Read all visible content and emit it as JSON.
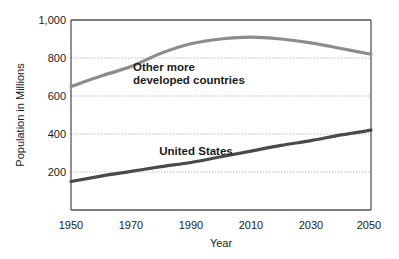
{
  "chart_data": {
    "type": "line",
    "title": "",
    "xlabel": "Year",
    "ylabel": "Population in Millions",
    "xlim": [
      1950,
      2050
    ],
    "ylim": [
      0,
      1000
    ],
    "xticks": [
      "1950",
      "1970",
      "1990",
      "2010",
      "2030",
      "2050"
    ],
    "xtick_values": [
      1950,
      1970,
      1990,
      2010,
      2030,
      2050
    ],
    "yticks": [
      "200",
      "400",
      "600",
      "800",
      "1,000"
    ],
    "ytick_values": [
      200,
      400,
      600,
      800,
      1000
    ],
    "grid": "horizontal-dotted",
    "legend": "inline-annotations",
    "series": [
      {
        "name": "Other more developed countries",
        "label_line1": "Other more",
        "label_line2": "developed countries",
        "color": "#8c8c8c",
        "x": [
          1950,
          1960,
          1970,
          1980,
          1990,
          2000,
          2010,
          2020,
          2030,
          2040,
          2050
        ],
        "values": [
          650,
          705,
          755,
          825,
          875,
          900,
          910,
          900,
          880,
          850,
          820
        ]
      },
      {
        "name": "United States",
        "label_line1": "United States",
        "label_line2": "",
        "color": "#4a4a4a",
        "x": [
          1950,
          1960,
          1970,
          1980,
          1990,
          2000,
          2010,
          2020,
          2030,
          2040,
          2050
        ],
        "values": [
          150,
          178,
          203,
          228,
          250,
          280,
          310,
          340,
          365,
          395,
          420
        ]
      }
    ]
  },
  "axes": {
    "y_title": "Population in Millions",
    "x_title": "Year"
  },
  "colors": {
    "other_countries_line": "#8c8c8c",
    "united_states_line": "#4a4a4a",
    "frame": "#555555",
    "gridline": "#b5b5b5",
    "text": "#1a1a1a",
    "background": "#ffffff"
  }
}
